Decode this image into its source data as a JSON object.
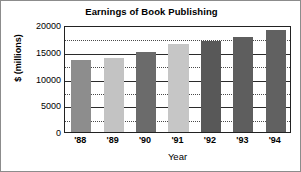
{
  "chart_data": {
    "type": "bar",
    "title": "Earnings of Book Publishing",
    "xlabel": "Year",
    "ylabel": "$ (millions)",
    "categories": [
      "'88",
      "'89",
      "'90",
      "'91",
      "'92",
      "'93",
      "'94"
    ],
    "values": [
      13500,
      13800,
      15000,
      16500,
      17000,
      17800,
      19000
    ],
    "bar_colors": [
      "#8d8d8d",
      "#c3c3c3",
      "#6b6b6b",
      "#c6c6c6",
      "#585858",
      "#5e5e5e",
      "#616161"
    ],
    "ylim": [
      0,
      20000
    ],
    "ytick_labels": [
      "0",
      "5000",
      "10000",
      "15000",
      "20000"
    ],
    "ytick_values": [
      0,
      5000,
      10000,
      15000,
      20000
    ],
    "minor_gridline_values": [
      2500,
      7500,
      12500,
      17500
    ],
    "grid": true,
    "legend": "none",
    "frame_color": "#222222",
    "background": "#ffffff"
  }
}
